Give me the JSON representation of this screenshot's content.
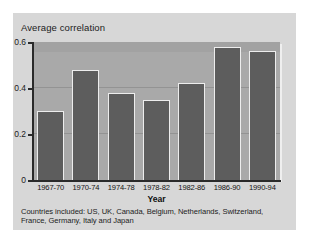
{
  "figure": {
    "y_axis_title": "Average correlation",
    "x_axis_title": "Year",
    "footnote": "Countries included: US, UK, Canada, Belgium, Netherlands, Switzerland, France, Germany, Italy and Japan",
    "colors": {
      "card_background": "#d7d7d7",
      "plot_background": "#a9a9a9",
      "bar_fill": "#5d5d5d",
      "bar_highlight": "#ededed",
      "axis": "#2a2a2a",
      "gridline": "#8f8f8f",
      "text": "#1c1c1c"
    }
  },
  "chart_data": {
    "type": "bar",
    "title": "",
    "subtitle": "",
    "xlabel": "Year",
    "ylabel": "Average correlation",
    "categories": [
      "1967-70",
      "1970-74",
      "1974-78",
      "1978-82",
      "1982-86",
      "1986-90",
      "1990-94"
    ],
    "values": [
      0.3,
      0.48,
      0.38,
      0.35,
      0.42,
      0.58,
      0.56
    ],
    "ylim": [
      0,
      0.6
    ],
    "ytick_labels": [
      "0",
      "0.2",
      "0.4",
      "0.6"
    ],
    "ytick_values": [
      0,
      0.2,
      0.4,
      0.6
    ],
    "gridlines": [
      0.2,
      0.4
    ],
    "grid": true,
    "legend": null,
    "legend_position": "none",
    "annotations": [
      "Countries included: US, UK, Canada, Belgium, Netherlands, Switzerland, France, Germany, Italy and Japan"
    ]
  }
}
